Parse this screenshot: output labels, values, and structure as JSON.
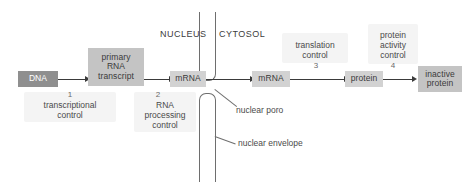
{
  "diagram": {
    "compartments": [
      {
        "name": "nucleus",
        "label": "NUCLEUS"
      },
      {
        "name": "cytosol",
        "label": "CYTOSOL"
      }
    ],
    "molecules": [
      {
        "name": "dna",
        "label": "DNA",
        "style": "dark"
      },
      {
        "name": "primary-transcript",
        "label": "primary\nRNA\ntranscript",
        "line1": "primary",
        "line2": "RNA",
        "line3": "transcript",
        "style": "mid"
      },
      {
        "name": "mrna-nuclear",
        "label": "mRNA",
        "style": "light"
      },
      {
        "name": "mrna-cytosolic",
        "label": "mRNA",
        "style": "light"
      },
      {
        "name": "protein",
        "label": "protein",
        "style": "light"
      },
      {
        "name": "inactive-protein",
        "label": "inactive\nprotein",
        "line1": "inactive",
        "line2": "protein",
        "style": "mid"
      }
    ],
    "steps": [
      {
        "number": "1",
        "line1": "transcriptional",
        "line2": "control",
        "line3": ""
      },
      {
        "number": "2",
        "line1": "RNA",
        "line2": "processing",
        "line3": "control"
      },
      {
        "number": "3",
        "line1": "translation",
        "line2": "control",
        "line3": ""
      },
      {
        "number": "4",
        "line1": "protein",
        "line2": "activity",
        "line3": "control"
      }
    ],
    "structures": [
      {
        "name": "nuclear-pore",
        "label": "nuclear poro"
      },
      {
        "name": "nuclear-envelope",
        "label": "nuclear envelope"
      }
    ],
    "colors": {
      "box_dark": "#8f8f8f",
      "box_mid": "#c4c4c4",
      "box_light": "#d2d2d2",
      "arrow": "#3a3a3a",
      "membrane": "#6e6e6e",
      "text": "#4a4a4a",
      "background": "#ffffff"
    }
  }
}
